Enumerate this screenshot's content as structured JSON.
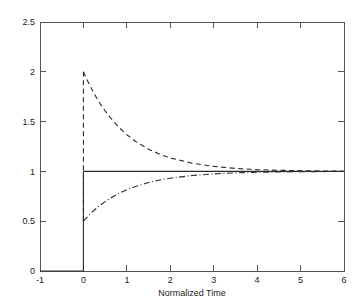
{
  "chart_data": {
    "type": "line",
    "title": "",
    "subtitle": "",
    "xlabel": "Normalized Time",
    "ylabel": "",
    "xlim": [
      -1,
      6
    ],
    "ylim": [
      0,
      2.5
    ],
    "xticks": [
      -1,
      0,
      1,
      2,
      3,
      4,
      5,
      6
    ],
    "xticklabels": [
      "-1",
      "0",
      "1",
      "2",
      "3",
      "4",
      "5",
      "6"
    ],
    "yticks": [
      0,
      0.5,
      1,
      1.5,
      2,
      2.5
    ],
    "yticklabels": [
      "0",
      "0.5",
      "1",
      "1.5",
      "2",
      "2.5"
    ],
    "grid": false,
    "legend": null,
    "box": true,
    "tick_direction": "in",
    "ticks_all_sides": true,
    "line_color": "#2b2b2b",
    "axis_color": "#555555",
    "background": "#ffffff",
    "series": [
      {
        "name": "unit-step",
        "style": "solid",
        "description": "Ideal unit step: 0 for t<0, 1 for t>=0",
        "x": [
          -1,
          -0.001,
          0,
          0.5,
          1,
          1.5,
          2,
          2.5,
          3,
          3.5,
          4,
          4.5,
          5,
          5.5,
          6
        ],
        "values": [
          0,
          0,
          1,
          1,
          1,
          1,
          1,
          1,
          1,
          1,
          1,
          1,
          1,
          1,
          1
        ]
      },
      {
        "name": "overshoot-response",
        "style": "dashed",
        "description": "Steps to 2.0 at t=0 then decays exponentially to 1.0",
        "x": [
          0,
          0.1,
          0.2,
          0.3,
          0.4,
          0.5,
          0.6,
          0.8,
          1.0,
          1.2,
          1.5,
          1.8,
          2.0,
          2.5,
          3.0,
          3.5,
          4.0,
          4.5,
          5.0,
          5.5,
          6.0
        ],
        "values": [
          2.0,
          1.905,
          1.819,
          1.741,
          1.67,
          1.607,
          1.549,
          1.449,
          1.368,
          1.301,
          1.223,
          1.165,
          1.135,
          1.082,
          1.05,
          1.03,
          1.018,
          1.011,
          1.007,
          1.004,
          1.002
        ]
      },
      {
        "name": "undershoot-response",
        "style": "dashdot",
        "description": "Steps to 0.5 at t=0 then rises exponentially to 1.0",
        "x": [
          0,
          0.1,
          0.2,
          0.3,
          0.4,
          0.5,
          0.6,
          0.8,
          1.0,
          1.2,
          1.5,
          1.8,
          2.0,
          2.5,
          3.0,
          3.5,
          4.0,
          4.5,
          5.0,
          5.5,
          6.0
        ],
        "values": [
          0.5,
          0.548,
          0.591,
          0.63,
          0.665,
          0.697,
          0.726,
          0.775,
          0.816,
          0.849,
          0.888,
          0.917,
          0.932,
          0.959,
          0.975,
          0.985,
          0.991,
          0.994,
          0.997,
          0.998,
          0.999
        ]
      },
      {
        "name": "initial-jump-connector",
        "style": "dashed",
        "description": "Vertical dashed segment at t=0 from 0.5 to 2.0",
        "x": [
          0,
          0
        ],
        "values": [
          0.5,
          2.0
        ]
      }
    ]
  }
}
